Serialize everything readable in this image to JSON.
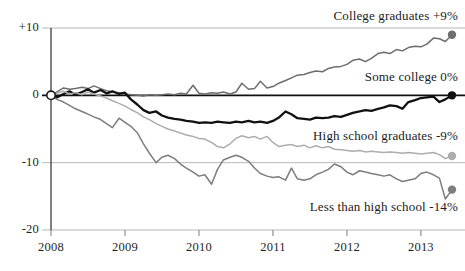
{
  "chart_data": {
    "type": "line",
    "title": "",
    "subtitle": "",
    "xlabel": "",
    "ylabel": "",
    "xlim": [
      2008.0,
      2013.42
    ],
    "ylim": [
      -20,
      10
    ],
    "grid": true,
    "gridlines_y": [
      10,
      0,
      -10,
      -20
    ],
    "zero_line": 0,
    "legend_position": "inline-right",
    "y_tick_labels": [
      "+10",
      "0",
      "-10",
      "-20"
    ],
    "y_ticks": [
      10,
      0,
      -10,
      -20
    ],
    "x_tick_labels": [
      "2008",
      "2009",
      "2010",
      "2011",
      "2012",
      "2013"
    ],
    "x_ticks": [
      2008,
      2009,
      2010,
      2011,
      2012,
      2013
    ],
    "units": "percent change in employment since 2008",
    "series": [
      {
        "name": "College graduates",
        "end_label": "College graduates +9%",
        "end_value": 9,
        "color": "#6e6e6e",
        "marker_end": "filled-dot",
        "x": [
          2008.0,
          2008.08,
          2008.17,
          2008.25,
          2008.33,
          2008.42,
          2008.5,
          2008.58,
          2008.67,
          2008.75,
          2008.83,
          2008.92,
          2009.0,
          2009.08,
          2009.17,
          2009.25,
          2009.33,
          2009.42,
          2009.5,
          2009.58,
          2009.67,
          2009.75,
          2009.83,
          2009.92,
          2010.0,
          2010.08,
          2010.17,
          2010.25,
          2010.33,
          2010.42,
          2010.5,
          2010.58,
          2010.67,
          2010.75,
          2010.83,
          2010.92,
          2011.0,
          2011.08,
          2011.17,
          2011.25,
          2011.33,
          2011.42,
          2011.5,
          2011.58,
          2011.67,
          2011.75,
          2011.83,
          2011.92,
          2012.0,
          2012.08,
          2012.17,
          2012.25,
          2012.33,
          2012.42,
          2012.5,
          2012.58,
          2012.67,
          2012.75,
          2012.83,
          2012.92,
          2013.0,
          2013.08,
          2013.17,
          2013.25,
          2013.33,
          2013.42
        ],
        "values": [
          0.0,
          0.5,
          1.1,
          0.9,
          1.0,
          1.2,
          1.0,
          1.4,
          1.0,
          0.7,
          0.5,
          0.4,
          0.2,
          0.1,
          0.0,
          -0.1,
          0.1,
          0.0,
          0.1,
          0.2,
          0.1,
          0.3,
          0.2,
          1.5,
          0.3,
          0.2,
          0.4,
          0.3,
          0.5,
          0.2,
          0.5,
          1.8,
          0.9,
          1.0,
          2.1,
          1.1,
          1.3,
          1.8,
          2.2,
          2.6,
          3.0,
          3.1,
          3.4,
          3.6,
          3.5,
          4.0,
          4.2,
          4.3,
          4.6,
          5.2,
          5.4,
          5.0,
          5.5,
          6.2,
          6.4,
          6.2,
          6.8,
          6.6,
          7.1,
          7.3,
          7.2,
          7.6,
          8.5,
          8.4,
          8.0,
          9.0
        ]
      },
      {
        "name": "Some college",
        "end_label": "Some college 0%",
        "end_value": 0,
        "color": "#111111",
        "marker_end": "filled-dot",
        "x": [
          2008.0,
          2008.08,
          2008.17,
          2008.25,
          2008.33,
          2008.42,
          2008.5,
          2008.58,
          2008.67,
          2008.75,
          2008.83,
          2008.92,
          2009.0,
          2009.08,
          2009.17,
          2009.25,
          2009.33,
          2009.42,
          2009.5,
          2009.58,
          2009.67,
          2009.75,
          2009.83,
          2009.92,
          2010.0,
          2010.08,
          2010.17,
          2010.25,
          2010.33,
          2010.42,
          2010.5,
          2010.58,
          2010.67,
          2010.75,
          2010.83,
          2010.92,
          2011.0,
          2011.08,
          2011.17,
          2011.25,
          2011.33,
          2011.42,
          2011.5,
          2011.58,
          2011.67,
          2011.75,
          2011.83,
          2011.92,
          2012.0,
          2012.08,
          2012.17,
          2012.25,
          2012.33,
          2012.42,
          2012.5,
          2012.58,
          2012.67,
          2012.75,
          2012.83,
          2012.92,
          2013.0,
          2013.08,
          2013.17,
          2013.25,
          2013.33,
          2013.42
        ],
        "values": [
          0.0,
          -0.3,
          0.2,
          0.6,
          0.1,
          0.5,
          0.9,
          0.4,
          0.8,
          0.3,
          0.6,
          0.2,
          0.4,
          -0.6,
          -1.4,
          -2.2,
          -2.6,
          -2.4,
          -3.0,
          -3.3,
          -3.5,
          -3.6,
          -3.8,
          -3.9,
          -4.1,
          -4.0,
          -4.1,
          -3.9,
          -4.0,
          -4.1,
          -3.9,
          -4.0,
          -3.8,
          -4.0,
          -3.9,
          -4.1,
          -3.8,
          -3.3,
          -2.4,
          -2.8,
          -3.4,
          -3.5,
          -3.6,
          -3.3,
          -3.4,
          -3.3,
          -3.1,
          -3.2,
          -2.9,
          -2.6,
          -2.4,
          -2.2,
          -2.3,
          -2.0,
          -1.8,
          -1.5,
          -1.6,
          -2.0,
          -1.0,
          -0.7,
          -0.4,
          -0.3,
          -0.2,
          -1.0,
          -0.6,
          0.0
        ]
      },
      {
        "name": "High school graduates",
        "end_label": "High school graduates -9%",
        "end_value": -9,
        "color": "#adadad",
        "marker_end": "filled-dot",
        "x": [
          2008.0,
          2008.08,
          2008.17,
          2008.25,
          2008.33,
          2008.42,
          2008.5,
          2008.58,
          2008.67,
          2008.75,
          2008.83,
          2008.92,
          2009.0,
          2009.08,
          2009.17,
          2009.25,
          2009.33,
          2009.42,
          2009.5,
          2009.58,
          2009.67,
          2009.75,
          2009.83,
          2009.92,
          2010.0,
          2010.08,
          2010.17,
          2010.25,
          2010.33,
          2010.42,
          2010.5,
          2010.58,
          2010.67,
          2010.75,
          2010.83,
          2010.92,
          2011.0,
          2011.08,
          2011.17,
          2011.25,
          2011.33,
          2011.42,
          2011.5,
          2011.58,
          2011.67,
          2011.75,
          2011.83,
          2011.92,
          2012.0,
          2012.08,
          2012.17,
          2012.25,
          2012.33,
          2012.42,
          2012.5,
          2012.58,
          2012.67,
          2012.75,
          2012.83,
          2012.92,
          2013.0,
          2013.08,
          2013.17,
          2013.25,
          2013.33,
          2013.42
        ],
        "values": [
          0.0,
          0.3,
          0.6,
          0.2,
          0.4,
          0.1,
          0.5,
          0.2,
          -0.1,
          -0.4,
          -0.8,
          -1.2,
          -1.6,
          -2.1,
          -2.6,
          -3.2,
          -3.6,
          -4.2,
          -4.6,
          -5.0,
          -5.3,
          -5.6,
          -5.9,
          -6.1,
          -6.4,
          -6.5,
          -7.0,
          -7.6,
          -7.8,
          -7.2,
          -6.4,
          -6.0,
          -6.3,
          -6.1,
          -6.5,
          -6.1,
          -7.0,
          -7.6,
          -7.4,
          -7.3,
          -7.6,
          -7.4,
          -7.8,
          -7.5,
          -7.8,
          -7.6,
          -8.0,
          -8.1,
          -8.2,
          -8.3,
          -8.2,
          -8.4,
          -8.3,
          -8.4,
          -8.5,
          -8.4,
          -8.5,
          -8.6,
          -8.5,
          -8.6,
          -8.7,
          -8.6,
          -8.5,
          -8.8,
          -9.4,
          -9.0
        ]
      },
      {
        "name": "Less than high school",
        "end_label": "Less than high school -14%",
        "end_value": -14,
        "color": "#7d7d7d",
        "marker_end": "filled-dot",
        "x": [
          2008.0,
          2008.08,
          2008.17,
          2008.25,
          2008.33,
          2008.42,
          2008.5,
          2008.58,
          2008.67,
          2008.75,
          2008.83,
          2008.92,
          2009.0,
          2009.08,
          2009.17,
          2009.25,
          2009.33,
          2009.42,
          2009.5,
          2009.58,
          2009.67,
          2009.75,
          2009.83,
          2009.92,
          2010.0,
          2010.08,
          2010.17,
          2010.25,
          2010.33,
          2010.42,
          2010.5,
          2010.58,
          2010.67,
          2010.75,
          2010.83,
          2010.92,
          2011.0,
          2011.08,
          2011.17,
          2011.25,
          2011.33,
          2011.42,
          2011.5,
          2011.58,
          2011.67,
          2011.75,
          2011.83,
          2011.92,
          2012.0,
          2012.08,
          2012.17,
          2012.25,
          2012.33,
          2012.42,
          2012.5,
          2012.58,
          2012.67,
          2012.75,
          2012.83,
          2012.92,
          2013.0,
          2013.08,
          2013.17,
          2013.25,
          2013.33,
          2013.42
        ],
        "values": [
          0.0,
          -0.6,
          -1.0,
          -1.5,
          -2.0,
          -2.4,
          -2.8,
          -3.2,
          -3.6,
          -4.2,
          -4.8,
          -3.4,
          -4.0,
          -4.6,
          -5.6,
          -7.2,
          -8.6,
          -10.0,
          -9.2,
          -8.9,
          -9.4,
          -10.2,
          -10.8,
          -11.4,
          -12.0,
          -11.8,
          -13.2,
          -11.0,
          -9.6,
          -9.2,
          -8.9,
          -9.2,
          -9.8,
          -10.8,
          -11.6,
          -12.0,
          -12.2,
          -12.1,
          -12.6,
          -10.8,
          -12.4,
          -12.6,
          -12.4,
          -11.8,
          -11.4,
          -11.0,
          -10.2,
          -10.6,
          -11.4,
          -11.8,
          -11.2,
          -11.4,
          -11.6,
          -11.8,
          -12.0,
          -11.8,
          -12.4,
          -12.8,
          -12.6,
          -12.4,
          -11.6,
          -11.4,
          -11.8,
          -12.3,
          -15.4,
          -14.0
        ]
      }
    ],
    "origin_marker": {
      "x": 2008,
      "y": 0,
      "style": "hollow-circle"
    }
  }
}
